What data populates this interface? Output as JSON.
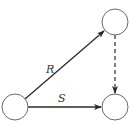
{
  "diagram": {
    "type": "commutative-diagram",
    "nodes": [
      {
        "id": "bottom-left",
        "label": "",
        "cx": 15,
        "cy": 107,
        "r": 13
      },
      {
        "id": "top-right",
        "label": "",
        "cx": 115,
        "cy": 22,
        "r": 13
      },
      {
        "id": "bottom-right",
        "label": "",
        "cx": 115,
        "cy": 107,
        "r": 13
      }
    ],
    "edges": [
      {
        "id": "edge-r",
        "from": "bottom-left",
        "to": "top-right",
        "label": "R",
        "style": "solid"
      },
      {
        "id": "edge-s",
        "from": "bottom-left",
        "to": "bottom-right",
        "label": "S",
        "style": "solid"
      },
      {
        "id": "edge-dashed",
        "from": "top-right",
        "to": "bottom-right",
        "label": "",
        "style": "dashed"
      }
    ],
    "labels": {
      "r": "R",
      "s": "S"
    },
    "colors": {
      "node_stroke": "#6a6a6a",
      "edge": "#2a2a2a",
      "text": "#333333",
      "background": "#ffffff"
    }
  }
}
